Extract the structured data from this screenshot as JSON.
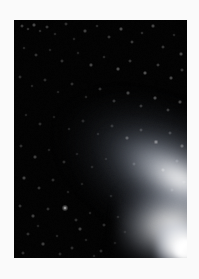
{
  "page": {
    "background_color": "#fafafa",
    "width": 199,
    "height": 279
  },
  "photo": {
    "subject": "comet",
    "frame": {
      "x": 14,
      "y": 20,
      "width": 173,
      "height": 238
    },
    "sky_color": "#030303",
    "glow_color": "#ffffff",
    "caption": "",
    "features": [
      {
        "name": "nucleus",
        "label": "Nucleus",
        "x": 172,
        "y": 229
      },
      {
        "name": "coma",
        "label": "Coma",
        "x": 166,
        "y": 225
      },
      {
        "name": "dust-tail",
        "label": "Dust tail",
        "angle_deg": 31
      },
      {
        "name": "star-field",
        "label": "Star field"
      }
    ]
  },
  "chart_data": {
    "type": "scatter",
    "title": "",
    "xlabel": "",
    "ylabel": "",
    "xlim": [
      0,
      173
    ],
    "ylim": [
      0,
      238
    ],
    "grid": false,
    "legend": "none",
    "note": "Star positions within the photographic frame, x/y in frame pixels, r = radius px, b = brightness 0-1",
    "series": [
      {
        "name": "stars",
        "points": [
          {
            "x": 8,
            "y": 6,
            "r": 0.8,
            "b": 0.46
          },
          {
            "x": 14,
            "y": 9,
            "r": 0.7,
            "b": 0.38
          },
          {
            "x": 20,
            "y": 5,
            "r": 0.9,
            "b": 0.5
          },
          {
            "x": 26,
            "y": 11,
            "r": 0.7,
            "b": 0.34
          },
          {
            "x": 33,
            "y": 7,
            "r": 0.8,
            "b": 0.42
          },
          {
            "x": 41,
            "y": 14,
            "r": 0.7,
            "b": 0.3
          },
          {
            "x": 52,
            "y": 4,
            "r": 0.8,
            "b": 0.36
          },
          {
            "x": 60,
            "y": 19,
            "r": 0.7,
            "b": 0.28
          },
          {
            "x": 71,
            "y": 11,
            "r": 0.9,
            "b": 0.44
          },
          {
            "x": 83,
            "y": 6,
            "r": 0.7,
            "b": 0.32
          },
          {
            "x": 95,
            "y": 17,
            "r": 0.8,
            "b": 0.4
          },
          {
            "x": 107,
            "y": 9,
            "r": 0.9,
            "b": 0.52
          },
          {
            "x": 118,
            "y": 22,
            "r": 0.8,
            "b": 0.44
          },
          {
            "x": 128,
            "y": 13,
            "r": 0.7,
            "b": 0.34
          },
          {
            "x": 139,
            "y": 6,
            "r": 0.9,
            "b": 0.48
          },
          {
            "x": 149,
            "y": 27,
            "r": 0.8,
            "b": 0.42
          },
          {
            "x": 160,
            "y": 15,
            "r": 0.7,
            "b": 0.3
          },
          {
            "x": 167,
            "y": 34,
            "r": 0.9,
            "b": 0.5
          },
          {
            "x": 10,
            "y": 28,
            "r": 0.7,
            "b": 0.3
          },
          {
            "x": 22,
            "y": 35,
            "r": 0.8,
            "b": 0.38
          },
          {
            "x": 36,
            "y": 30,
            "r": 0.7,
            "b": 0.26
          },
          {
            "x": 48,
            "y": 41,
            "r": 0.8,
            "b": 0.36
          },
          {
            "x": 64,
            "y": 33,
            "r": 0.7,
            "b": 0.28
          },
          {
            "x": 77,
            "y": 45,
            "r": 0.9,
            "b": 0.46
          },
          {
            "x": 90,
            "y": 37,
            "r": 0.7,
            "b": 0.32
          },
          {
            "x": 104,
            "y": 49,
            "r": 0.9,
            "b": 0.54
          },
          {
            "x": 116,
            "y": 41,
            "r": 0.8,
            "b": 0.4
          },
          {
            "x": 131,
            "y": 53,
            "r": 0.9,
            "b": 0.56
          },
          {
            "x": 144,
            "y": 45,
            "r": 0.8,
            "b": 0.44
          },
          {
            "x": 157,
            "y": 58,
            "r": 0.9,
            "b": 0.5
          },
          {
            "x": 168,
            "y": 50,
            "r": 0.8,
            "b": 0.4
          },
          {
            "x": 6,
            "y": 57,
            "r": 0.8,
            "b": 0.34
          },
          {
            "x": 18,
            "y": 66,
            "r": 0.7,
            "b": 0.28
          },
          {
            "x": 31,
            "y": 60,
            "r": 0.8,
            "b": 0.32
          },
          {
            "x": 44,
            "y": 72,
            "r": 0.7,
            "b": 0.26
          },
          {
            "x": 58,
            "y": 64,
            "r": 0.8,
            "b": 0.34
          },
          {
            "x": 72,
            "y": 77,
            "r": 0.7,
            "b": 0.28
          },
          {
            "x": 86,
            "y": 69,
            "r": 0.8,
            "b": 0.36
          },
          {
            "x": 100,
            "y": 81,
            "r": 0.8,
            "b": 0.38
          },
          {
            "x": 114,
            "y": 73,
            "r": 0.9,
            "b": 0.48
          },
          {
            "x": 127,
            "y": 86,
            "r": 0.8,
            "b": 0.42
          },
          {
            "x": 141,
            "y": 78,
            "r": 0.9,
            "b": 0.52
          },
          {
            "x": 154,
            "y": 90,
            "r": 0.8,
            "b": 0.44
          },
          {
            "x": 166,
            "y": 82,
            "r": 0.9,
            "b": 0.5
          },
          {
            "x": 12,
            "y": 95,
            "r": 0.7,
            "b": 0.26
          },
          {
            "x": 26,
            "y": 104,
            "r": 0.8,
            "b": 0.32
          },
          {
            "x": 40,
            "y": 97,
            "r": 0.7,
            "b": 0.24
          },
          {
            "x": 55,
            "y": 109,
            "r": 0.7,
            "b": 0.26
          },
          {
            "x": 69,
            "y": 101,
            "r": 0.8,
            "b": 0.3
          },
          {
            "x": 84,
            "y": 114,
            "r": 0.7,
            "b": 0.28
          },
          {
            "x": 98,
            "y": 106,
            "r": 0.8,
            "b": 0.34
          },
          {
            "x": 113,
            "y": 118,
            "r": 0.9,
            "b": 0.46
          },
          {
            "x": 127,
            "y": 110,
            "r": 0.8,
            "b": 0.4
          },
          {
            "x": 142,
            "y": 122,
            "r": 1.0,
            "b": 0.62
          },
          {
            "x": 156,
            "y": 113,
            "r": 0.8,
            "b": 0.42
          },
          {
            "x": 168,
            "y": 126,
            "r": 0.9,
            "b": 0.48
          },
          {
            "x": 7,
            "y": 126,
            "r": 0.8,
            "b": 0.34
          },
          {
            "x": 21,
            "y": 137,
            "r": 0.9,
            "b": 0.44
          },
          {
            "x": 35,
            "y": 130,
            "r": 0.7,
            "b": 0.26
          },
          {
            "x": 50,
            "y": 142,
            "r": 0.8,
            "b": 0.32
          },
          {
            "x": 63,
            "y": 134,
            "r": 0.7,
            "b": 0.24
          },
          {
            "x": 78,
            "y": 147,
            "r": 0.7,
            "b": 0.26
          },
          {
            "x": 92,
            "y": 139,
            "r": 0.7,
            "b": 0.24
          },
          {
            "x": 120,
            "y": 144,
            "r": 0.8,
            "b": 0.36
          },
          {
            "x": 149,
            "y": 150,
            "r": 0.9,
            "b": 0.46
          },
          {
            "x": 163,
            "y": 141,
            "r": 0.8,
            "b": 0.4
          },
          {
            "x": 10,
            "y": 158,
            "r": 0.9,
            "b": 0.46
          },
          {
            "x": 25,
            "y": 168,
            "r": 0.8,
            "b": 0.38
          },
          {
            "x": 39,
            "y": 160,
            "r": 0.8,
            "b": 0.34
          },
          {
            "x": 54,
            "y": 172,
            "r": 0.7,
            "b": 0.26
          },
          {
            "x": 68,
            "y": 164,
            "r": 0.7,
            "b": 0.24
          },
          {
            "x": 97,
            "y": 176,
            "r": 0.7,
            "b": 0.26
          },
          {
            "x": 158,
            "y": 170,
            "r": 0.8,
            "b": 0.4
          },
          {
            "x": 170,
            "y": 162,
            "r": 0.8,
            "b": 0.36
          },
          {
            "x": 6,
            "y": 186,
            "r": 0.8,
            "b": 0.38
          },
          {
            "x": 19,
            "y": 196,
            "r": 0.9,
            "b": 0.44
          },
          {
            "x": 34,
            "y": 189,
            "r": 0.8,
            "b": 0.36
          },
          {
            "x": 51,
            "y": 188,
            "r": 1.3,
            "b": 0.88
          },
          {
            "x": 62,
            "y": 200,
            "r": 0.8,
            "b": 0.34
          },
          {
            "x": 76,
            "y": 193,
            "r": 0.7,
            "b": 0.28
          },
          {
            "x": 90,
            "y": 205,
            "r": 0.8,
            "b": 0.34
          },
          {
            "x": 104,
            "y": 197,
            "r": 0.7,
            "b": 0.26
          },
          {
            "x": 14,
            "y": 214,
            "r": 0.8,
            "b": 0.36
          },
          {
            "x": 29,
            "y": 224,
            "r": 0.9,
            "b": 0.42
          },
          {
            "x": 43,
            "y": 216,
            "r": 0.7,
            "b": 0.28
          },
          {
            "x": 58,
            "y": 228,
            "r": 0.8,
            "b": 0.34
          },
          {
            "x": 72,
            "y": 220,
            "r": 0.7,
            "b": 0.26
          },
          {
            "x": 87,
            "y": 231,
            "r": 0.8,
            "b": 0.32
          },
          {
            "x": 101,
            "y": 223,
            "r": 0.7,
            "b": 0.26
          },
          {
            "x": 9,
            "y": 233,
            "r": 0.8,
            "b": 0.34
          },
          {
            "x": 24,
            "y": 206,
            "r": 0.7,
            "b": 0.26
          },
          {
            "x": 46,
            "y": 234,
            "r": 0.8,
            "b": 0.3
          },
          {
            "x": 66,
            "y": 209,
            "r": 0.9,
            "b": 0.44
          },
          {
            "x": 111,
            "y": 212,
            "r": 0.7,
            "b": 0.26
          },
          {
            "x": 80,
            "y": 236,
            "r": 0.7,
            "b": 0.24
          }
        ]
      }
    ]
  }
}
